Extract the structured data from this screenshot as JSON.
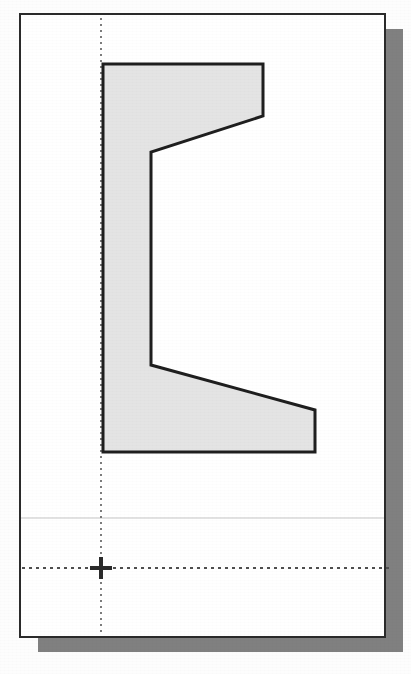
{
  "document": {
    "kind": "scanned-technical-drawing",
    "title": "",
    "canvas": {
      "width": 411,
      "height": 674
    },
    "background_color": "#fdfdfd"
  },
  "colors": {
    "paper": "#ffffff",
    "page_border": "#2b2b2b",
    "drop_shadow": "#808080",
    "part_fill": "#e4e4e4",
    "part_outline": "#1f1f1f",
    "construction_line": "#7d7d7d",
    "faint_guide": "#d8d8d8",
    "crosshair": "#2b2b2b"
  },
  "page_sheet": {
    "name": "drawing-sheet",
    "x": 20,
    "y": 14,
    "width": 365,
    "height": 623,
    "border_width": 2
  },
  "drop_shadow": {
    "name": "sheet-drop-shadow",
    "offset_x": 18,
    "offset_y": 15,
    "color": "#808080"
  },
  "chart_data": {
    "type": "scatter",
    "xlabel": "",
    "ylabel": "",
    "xlim": [
      20,
      385
    ],
    "ylim": [
      14,
      637
    ],
    "grid": false,
    "legend": null,
    "annotations": [],
    "series": [
      {
        "name": "part-outline-polygon",
        "closed": true,
        "fill": "#e4e4e4",
        "stroke": "#1f1f1f",
        "stroke_width": 3,
        "points": [
          [
            103,
            64
          ],
          [
            263,
            64
          ],
          [
            263,
            116
          ],
          [
            151,
            152
          ],
          [
            151,
            365
          ],
          [
            315,
            410
          ],
          [
            315,
            452
          ],
          [
            103,
            452
          ]
        ],
        "vertex_labels": [
          "top-left",
          "top-right",
          "upper-flange-tip",
          "upper-web-inner",
          "lower-web-inner",
          "lower-flange-tip",
          "bottom-right",
          "bottom-left"
        ]
      }
    ]
  },
  "construction_lines": {
    "vertical_datum": {
      "name": "vertical-datum-line",
      "x": 101,
      "y1": 18,
      "y2": 636,
      "style": "dotted"
    },
    "horizontal_datum": {
      "name": "horizontal-datum-line",
      "y": 568,
      "x1": 22,
      "x2": 392,
      "style": "dashed"
    },
    "faint_horizontal_guide": {
      "name": "faint-horizontal-guide",
      "y": 518,
      "x1": 21,
      "x2": 384,
      "style": "solid-faint"
    }
  },
  "origin_marker": {
    "name": "origin-crosshair",
    "x": 101,
    "y": 568,
    "arm_length": 11,
    "stroke_width": 4
  }
}
